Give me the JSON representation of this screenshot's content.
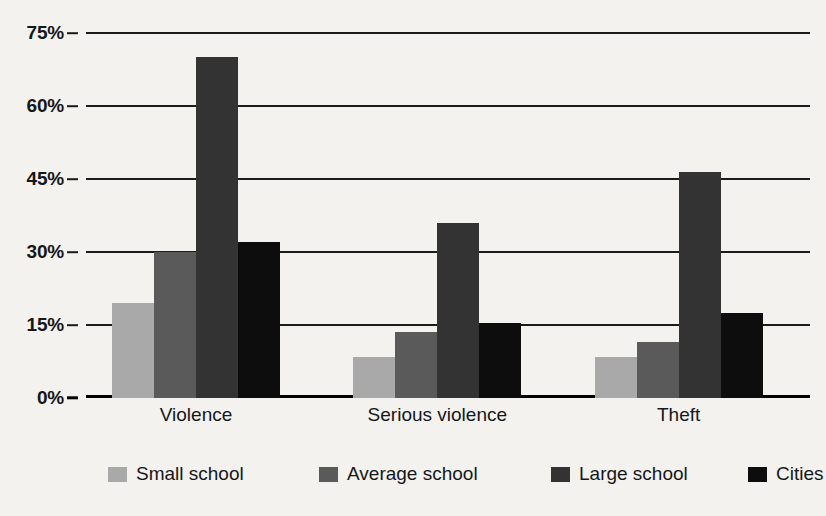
{
  "chart_data": {
    "type": "bar",
    "title": "",
    "subtitle": "",
    "xlabel": "",
    "ylabel": "",
    "categories": [
      "Violence",
      "Serious violence",
      "Theft"
    ],
    "series": [
      {
        "name": "Small school",
        "color": "#a9a9a9",
        "values": [
          19.5,
          8.5,
          8.5
        ]
      },
      {
        "name": "Average school",
        "color": "#5a5a5a",
        "values": [
          30.0,
          13.5,
          11.5
        ]
      },
      {
        "name": "Large school",
        "color": "#333333",
        "values": [
          70.0,
          36.0,
          46.5
        ]
      },
      {
        "name": "Cities",
        "color": "#0d0d0d",
        "values": [
          32.0,
          15.5,
          17.5
        ]
      }
    ],
    "ylim": [
      0,
      75
    ],
    "y_ticks": [
      0,
      15,
      30,
      45,
      60,
      75
    ],
    "y_tick_labels": [
      "0%",
      "15%",
      "30%",
      "45%",
      "60%",
      "75%"
    ],
    "grid": true,
    "legend_position": "bottom",
    "background_color": "#f3f2ee",
    "axis_color": "#1b1b1b"
  }
}
